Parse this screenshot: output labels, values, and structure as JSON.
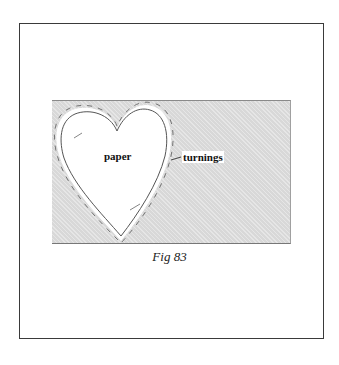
{
  "figure": {
    "caption": "Fig 83",
    "labels": {
      "paper": "paper",
      "turnings": "turnings"
    },
    "colors": {
      "frame": "#3a3a3a",
      "panel": "#d8d8d8",
      "heart_fill": "#ffffff",
      "outline": "#555555"
    }
  }
}
